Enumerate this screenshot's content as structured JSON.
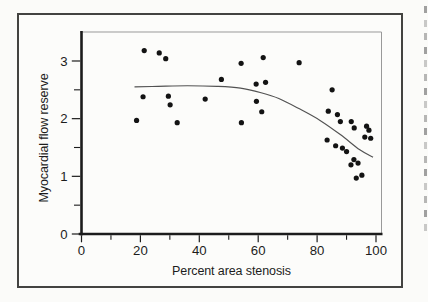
{
  "figure": {
    "frame_color": "#434341",
    "background": "#fbfbf9"
  },
  "chart_data": {
    "type": "scatter",
    "title": "",
    "xlabel": "Percent area stenosis",
    "ylabel": "Myocardial flow reserve",
    "xlim": [
      0,
      102
    ],
    "ylim": [
      0,
      3.5
    ],
    "grid": false,
    "legend": null,
    "x_major_ticks": [
      0,
      20,
      40,
      60,
      80,
      100
    ],
    "x_minor_ticks": [
      10,
      30,
      50,
      70,
      90
    ],
    "y_major_ticks": [
      0,
      1,
      2,
      3
    ],
    "y_minor_ticks": [
      0.5,
      1.5,
      2.5
    ],
    "point_color": "#131313",
    "curve_color": "#525252",
    "axis_color": "#1c1c1c",
    "secondary_spine_color": "#999999",
    "points": [
      [
        21.3,
        3.18
      ],
      [
        26.4,
        3.14
      ],
      [
        28.6,
        3.04
      ],
      [
        20.9,
        2.38
      ],
      [
        29.5,
        2.39
      ],
      [
        30.1,
        2.24
      ],
      [
        18.7,
        1.97
      ],
      [
        32.5,
        1.93
      ],
      [
        42.0,
        2.34
      ],
      [
        47.5,
        2.68
      ],
      [
        54.2,
        2.96
      ],
      [
        54.3,
        1.93
      ],
      [
        59.3,
        2.6
      ],
      [
        59.4,
        2.3
      ],
      [
        61.2,
        2.12
      ],
      [
        61.7,
        3.06
      ],
      [
        62.5,
        2.63
      ],
      [
        73.9,
        2.97
      ],
      [
        83.4,
        1.63
      ],
      [
        83.8,
        2.13
      ],
      [
        85.1,
        2.5
      ],
      [
        86.3,
        1.53
      ],
      [
        86.9,
        2.07
      ],
      [
        87.9,
        1.95
      ],
      [
        88.6,
        1.49
      ],
      [
        90.0,
        1.43
      ],
      [
        91.5,
        1.2
      ],
      [
        91.6,
        1.95
      ],
      [
        92.5,
        1.29
      ],
      [
        92.6,
        1.84
      ],
      [
        93.3,
        0.97
      ],
      [
        93.9,
        1.23
      ],
      [
        95.2,
        1.02
      ],
      [
        96.2,
        1.68
      ],
      [
        96.8,
        1.87
      ],
      [
        97.6,
        1.8
      ],
      [
        98.2,
        1.66
      ]
    ],
    "fit_curve": [
      [
        18,
        2.55
      ],
      [
        26,
        2.56
      ],
      [
        36,
        2.57
      ],
      [
        46,
        2.56
      ],
      [
        54,
        2.53
      ],
      [
        61,
        2.45
      ],
      [
        67,
        2.35
      ],
      [
        74,
        2.17
      ],
      [
        81,
        1.97
      ],
      [
        88,
        1.72
      ],
      [
        94.5,
        1.46
      ],
      [
        99,
        1.33
      ]
    ]
  },
  "scan_artifacts": {
    "right_edge_marks": {
      "count": 17,
      "first_y": 6,
      "spacing": 13.6,
      "x": 424,
      "width": 3,
      "height": 7,
      "color": "#8a8a8a"
    }
  }
}
